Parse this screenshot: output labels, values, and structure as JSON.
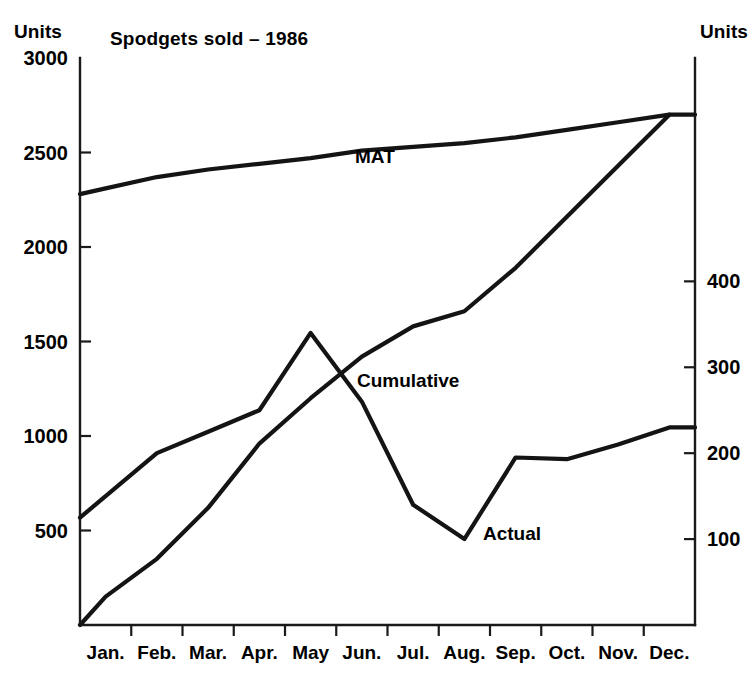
{
  "chart_data": {
    "type": "line",
    "title": "Spodgets sold – 1986",
    "xlabel": "",
    "ylabel": "Units",
    "y2label": "Units",
    "grid": false,
    "legend": "inline-annotations",
    "categories": [
      "Jan.",
      "Feb.",
      "Mar.",
      "Apr.",
      "May",
      "Jun.",
      "Jul.",
      "Aug.",
      "Sep.",
      "Oct.",
      "Nov.",
      "Dec."
    ],
    "left_axis": {
      "label": "Units",
      "ticks": [
        500,
        1000,
        1500,
        2000,
        2500,
        3000
      ],
      "tick_labels": [
        "500",
        "1000",
        "1500",
        "2000",
        "2500",
        "3000"
      ],
      "ylim": [
        0,
        3000
      ]
    },
    "right_axis": {
      "label": "Units",
      "ticks": [
        100,
        200,
        300,
        400
      ],
      "tick_labels": [
        "100",
        "200",
        "300",
        "400"
      ],
      "ylim": [
        0,
        660
      ]
    },
    "series": [
      {
        "name": "MAT",
        "axis": "left",
        "label": "MAT",
        "values": [
          2310,
          2370,
          2410,
          2440,
          2470,
          2510,
          2530,
          2550,
          2580,
          2620,
          2660,
          2700
        ]
      },
      {
        "name": "Cumulative",
        "axis": "left",
        "label": "Cumulative",
        "values": [
          150,
          350,
          620,
          960,
          1200,
          1420,
          1580,
          1660,
          1890,
          2160,
          2430,
          2700
        ]
      },
      {
        "name": "Actual",
        "axis": "right",
        "label": "Actual",
        "values": [
          150,
          200,
          225,
          250,
          340,
          260,
          140,
          100,
          195,
          193,
          210,
          230
        ]
      }
    ]
  },
  "annotations": {
    "mat": "MAT",
    "cumulative": "Cumulative",
    "actual": "Actual"
  }
}
